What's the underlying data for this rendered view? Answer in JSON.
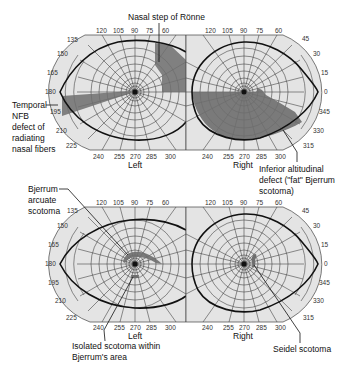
{
  "figure": {
    "panels": [
      {
        "id": "top-left",
        "eye_label": "Left",
        "angle_labels_top": [
          "120",
          "105",
          "90",
          "75",
          "60"
        ],
        "angle_labels_left": [
          "135",
          "150",
          "165",
          "180",
          "195",
          "210",
          "225"
        ],
        "angle_labels_bottom": [
          "240",
          "255",
          "270",
          "285",
          "300"
        ]
      },
      {
        "id": "top-right",
        "eye_label": "Right",
        "angle_labels_top": [
          "120",
          "105",
          "90",
          "75",
          "60"
        ],
        "angle_labels_right": [
          "45",
          "30",
          "15",
          "0",
          "345",
          "330",
          "315"
        ],
        "angle_labels_bottom": [
          "240",
          "255",
          "270",
          "285",
          "300"
        ]
      },
      {
        "id": "bottom-left",
        "eye_label": "Left",
        "angle_labels_top": [
          "120",
          "105",
          "90",
          "75",
          "60"
        ],
        "angle_labels_left": [
          "135",
          "150",
          "165",
          "180",
          "195",
          "210",
          "225"
        ],
        "angle_labels_bottom": [
          "240",
          "255",
          "270",
          "285",
          "300"
        ]
      },
      {
        "id": "bottom-right",
        "eye_label": "Right",
        "angle_labels_top": [
          "120",
          "105",
          "90",
          "75",
          "60"
        ],
        "angle_labels_right": [
          "45",
          "30",
          "15",
          "0",
          "345",
          "330",
          "315"
        ],
        "angle_labels_bottom": [
          "240",
          "255",
          "270",
          "285",
          "300"
        ]
      }
    ],
    "annotations": {
      "nasal_step": "Nasal step of Rönne",
      "temporal_nfb": [
        "Temporal",
        "NFB",
        "defect of",
        "radiating",
        "nasal fibers"
      ],
      "inferior_altitudinal": [
        "Inferior altitudinal",
        "defect (\"fat\" Bjerrum",
        "scotoma)"
      ],
      "bjerrum_arcuate": [
        "Bjerrum",
        "arcuate",
        "scotoma"
      ],
      "isolated_scotoma": [
        "Isolated scotoma within",
        "Bjerrum's area"
      ],
      "seidel": "Seidel scotoma"
    },
    "colors": {
      "field_bg": "#e4e4e4",
      "grid": "#444444",
      "defect": "#6e6e6e",
      "isopter": "#111111"
    }
  }
}
